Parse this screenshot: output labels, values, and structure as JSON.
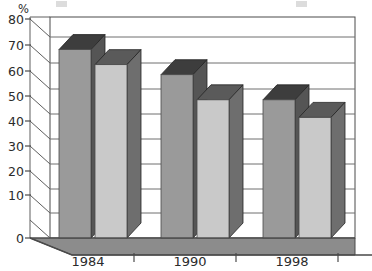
{
  "chart_data": {
    "type": "bar",
    "title": "",
    "subtitle": "",
    "xlabel": "",
    "ylabel": "%",
    "categories": [
      "1984",
      "1990",
      "1998"
    ],
    "series": [
      {
        "name": "Series 1",
        "values": [
          75,
          65,
          55
        ],
        "color": "#9a9a9a"
      },
      {
        "name": "Series 2",
        "values": [
          69,
          55,
          48
        ],
        "color": "#c9c9c9"
      }
    ],
    "ylim": [
      0,
      80
    ],
    "ytick_labels": [
      "0",
      "10",
      "20",
      "30",
      "40",
      "50",
      "60",
      "70",
      "80"
    ],
    "ytick_values": [
      0,
      10,
      20,
      30,
      40,
      50,
      60,
      70,
      80
    ],
    "grid": true,
    "grid_axis": "y",
    "legend": false,
    "legend_position": "top",
    "style": "3d-column",
    "depth_effect": true
  },
  "axes": {
    "unit_label": "%",
    "y_labels": [
      "80",
      "70",
      "60",
      "50",
      "40",
      "30",
      "20",
      "10",
      "0"
    ],
    "x_labels": [
      "1984",
      "1990",
      "1998"
    ]
  },
  "colors": {
    "series1_front": "#9a9a9a",
    "series1_top": "#3d3d3d",
    "series1_side": "#555555",
    "series2_front": "#c9c9c9",
    "series2_top": "#5a5a5a",
    "series2_side": "#6e6e6e",
    "floor": "#8c8c8c",
    "floor_edge": "#5a5a5a",
    "wall": "#ffffff",
    "gridline": "#6f6f6f",
    "axis": "#4a4a4a",
    "text": "#2b2b2b",
    "background": "#ffffff"
  },
  "legend_remnant": {
    "visible": true,
    "note": "cropped legend row at top edge"
  }
}
